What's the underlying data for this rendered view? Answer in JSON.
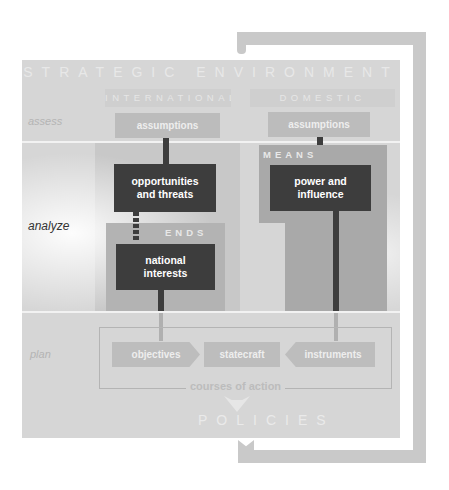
{
  "diagram": {
    "title": "STRATEGIC ENVIRONMENT",
    "bottom_title": "POLICIES",
    "phases": [
      {
        "label": "assess",
        "active": false
      },
      {
        "label": "analyze",
        "active": true
      },
      {
        "label": "plan",
        "active": false
      }
    ],
    "columns": {
      "international": {
        "label": "INTERNATIONAL",
        "assumptions": "assumptions"
      },
      "domestic": {
        "label": "DOMESTIC",
        "assumptions": "assumptions"
      }
    },
    "ends": {
      "label": "ENDS",
      "box": "national interests",
      "upstream_box": "opportunities and threats"
    },
    "means": {
      "label": "MEANS",
      "box": "power and influence"
    },
    "courses_of_action": {
      "label": "courses of action",
      "items": [
        "objectives",
        "statecraft",
        "instruments"
      ]
    },
    "colors": {
      "panel": "#d6d6d6",
      "dark_box": "#3d3d3d",
      "loop_arrow": "#c9c9c9",
      "active_phase_text": "#333333"
    }
  }
}
